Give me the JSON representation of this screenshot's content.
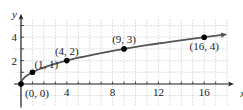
{
  "chart_data": {
    "type": "line",
    "title": "",
    "xlabel": "x",
    "ylabel": "y",
    "xlim": [
      -0.5,
      18.5
    ],
    "ylim": [
      -2,
      5.5
    ],
    "grid": true,
    "x_ticks": [
      4,
      8,
      12,
      16
    ],
    "y_ticks": [
      2,
      4
    ],
    "x_tick_labels": [
      "4",
      "8",
      "12",
      "16"
    ],
    "y_tick_labels": [
      "2",
      "4"
    ],
    "function": "y = sqrt(x)",
    "series": [
      {
        "name": "y = sqrt(x)",
        "x": [
          0,
          1,
          4,
          9,
          16
        ],
        "y": [
          0,
          1,
          2,
          3,
          4
        ]
      }
    ],
    "points": [
      {
        "x": 0,
        "y": 0,
        "label": "(0, 0)"
      },
      {
        "x": 1,
        "y": 1,
        "label": "(1, 1)"
      },
      {
        "x": 4,
        "y": 2,
        "label": "(4, 2)"
      },
      {
        "x": 9,
        "y": 3,
        "label": "(9, 3)"
      },
      {
        "x": 16,
        "y": 4,
        "label": "(16, 4)"
      }
    ],
    "colors": {
      "curve": "#555555",
      "points": "#000000",
      "grid": "#bbbbbb",
      "axis": "#222222"
    }
  }
}
